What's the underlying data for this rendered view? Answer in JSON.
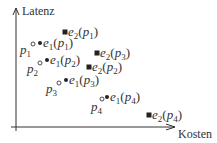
{
  "axes": {
    "x_label": "Kosten",
    "y_label": "Latenz"
  },
  "points": [
    {
      "id": "p1",
      "name": "p",
      "sub": "1",
      "cx": 33,
      "cy": 44,
      "lx": 20,
      "ly": 54
    },
    {
      "id": "p2",
      "name": "p",
      "sub": "2",
      "cx": 40,
      "cy": 63,
      "lx": 27,
      "ly": 73
    },
    {
      "id": "p3",
      "name": "p",
      "sub": "3",
      "cx": 59,
      "cy": 83,
      "lx": 46,
      "ly": 93
    },
    {
      "id": "p4",
      "name": "p",
      "sub": "4",
      "cx": 102,
      "cy": 99,
      "lx": 91,
      "ly": 111
    }
  ],
  "e1": [
    {
      "fn": "e",
      "fsub": "1",
      "arg": "p",
      "asub": "1",
      "x": 40,
      "y": 43
    },
    {
      "fn": "e",
      "fsub": "1",
      "arg": "p",
      "asub": "2",
      "x": 47,
      "y": 60
    },
    {
      "fn": "e",
      "fsub": "1",
      "arg": "p",
      "asub": "3",
      "x": 66,
      "y": 80
    },
    {
      "fn": "e",
      "fsub": "1",
      "arg": "p",
      "asub": "4",
      "x": 107,
      "y": 97
    }
  ],
  "e2": [
    {
      "fn": "e",
      "fsub": "2",
      "arg": "p",
      "asub": "1",
      "x": 65,
      "y": 32
    },
    {
      "fn": "e",
      "fsub": "2",
      "arg": "p",
      "asub": "3",
      "x": 97,
      "y": 53
    },
    {
      "fn": "e",
      "fsub": "2",
      "arg": "p",
      "asub": "2",
      "x": 89,
      "y": 67
    },
    {
      "fn": "e",
      "fsub": "2",
      "arg": "p",
      "asub": "4",
      "x": 149,
      "y": 115
    }
  ],
  "colors": {
    "axis": "#333333",
    "marker": "#222222",
    "text": "#333333"
  }
}
